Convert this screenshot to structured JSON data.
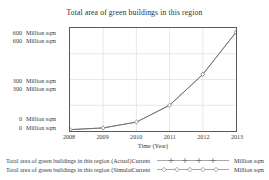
{
  "chart_data": {
    "type": "line",
    "title": "Total area of green buildings in this region",
    "xlabel": "Time (Year)",
    "ylabel": "Million sqm",
    "grid": true,
    "legend_position": "bottom",
    "x": [
      2008,
      2009,
      2010,
      2011,
      2012,
      2013
    ],
    "xlim": [
      2008,
      2013
    ],
    "ylim": [
      0,
      600
    ],
    "xticks": [
      "2008",
      "2009",
      "2010",
      "2011",
      "2012",
      "2013"
    ],
    "yticks": [
      {
        "value": "600",
        "unit": "Million sqm"
      },
      {
        "value": "600",
        "unit": "Million sqm"
      },
      {
        "value": "300",
        "unit": "Million sqm"
      },
      {
        "value": "300",
        "unit": "Million sqm"
      },
      {
        "value": "0",
        "unit": "Million sqm"
      },
      {
        "value": "0",
        "unit": "Million sqm"
      }
    ],
    "series": [
      {
        "name": "Total area of green buildings in this region (Actual)",
        "state": "Current",
        "unit": "Million sqm",
        "marker": "plus",
        "color": "#6b6b6b",
        "values": [
          8,
          18,
          52,
          150,
          330,
          575
        ]
      },
      {
        "name": "Total area of green buildings in this region (Simulate)",
        "state": "Current",
        "unit": "Million sqm",
        "marker": "diamond",
        "color": "#6b6b6b",
        "values": [
          8,
          18,
          52,
          150,
          330,
          575
        ]
      }
    ]
  }
}
